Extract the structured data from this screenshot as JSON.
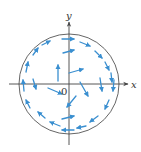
{
  "figure": {
    "title": "",
    "labels": {
      "x_axis": "x",
      "y_axis": "y",
      "origin": "0"
    },
    "colors": {
      "arrow": "#3a8fd0",
      "axis": "#444444",
      "circle": "#666666"
    },
    "circle": {
      "cx": 69,
      "cy": 84,
      "r": 50
    },
    "axes": {
      "x": {
        "x1": 9,
        "x2": 128,
        "y": 84
      },
      "y": {
        "x": 69,
        "y1": 145,
        "y2": 22
      }
    },
    "arrows": [
      {
        "x1": 62,
        "y1": 39,
        "x2": 74,
        "y2": 39
      },
      {
        "x1": 80,
        "y1": 42,
        "x2": 90,
        "y2": 46
      },
      {
        "x1": 95,
        "y1": 51,
        "x2": 102,
        "y2": 58
      },
      {
        "x1": 105,
        "y1": 62,
        "x2": 109,
        "y2": 70
      },
      {
        "x1": 111,
        "y1": 73,
        "x2": 112,
        "y2": 82
      },
      {
        "x1": 114,
        "y1": 80,
        "x2": 113,
        "y2": 91
      },
      {
        "x1": 100,
        "y1": 78,
        "x2": 102,
        "y2": 91
      },
      {
        "x1": 109,
        "y1": 100,
        "x2": 105,
        "y2": 109
      },
      {
        "x1": 98,
        "y1": 116,
        "x2": 90,
        "y2": 122
      },
      {
        "x1": 86,
        "y1": 126,
        "x2": 77,
        "y2": 128
      },
      {
        "x1": 74,
        "y1": 130,
        "x2": 62,
        "y2": 130
      },
      {
        "x1": 60,
        "y1": 126,
        "x2": 50,
        "y2": 122
      },
      {
        "x1": 45,
        "y1": 118,
        "x2": 38,
        "y2": 112
      },
      {
        "x1": 30,
        "y1": 108,
        "x2": 26,
        "y2": 100
      },
      {
        "x1": 24,
        "y1": 91,
        "x2": 23,
        "y2": 80
      },
      {
        "x1": 26,
        "y1": 72,
        "x2": 28,
        "y2": 62
      },
      {
        "x1": 33,
        "y1": 55,
        "x2": 38,
        "y2": 48
      },
      {
        "x1": 42,
        "y1": 45,
        "x2": 50,
        "y2": 41
      },
      {
        "x1": 63,
        "y1": 53,
        "x2": 74,
        "y2": 50
      },
      {
        "x1": 69,
        "y1": 73,
        "x2": 83,
        "y2": 69
      },
      {
        "x1": 58,
        "y1": 81,
        "x2": 58,
        "y2": 65
      },
      {
        "x1": 33,
        "y1": 79,
        "x2": 36,
        "y2": 89
      },
      {
        "x1": 48,
        "y1": 88,
        "x2": 62,
        "y2": 94
      },
      {
        "x1": 80,
        "y1": 82,
        "x2": 88,
        "y2": 96
      },
      {
        "x1": 76,
        "y1": 96,
        "x2": 67,
        "y2": 107
      },
      {
        "x1": 62,
        "y1": 119,
        "x2": 74,
        "y2": 116
      }
    ]
  }
}
